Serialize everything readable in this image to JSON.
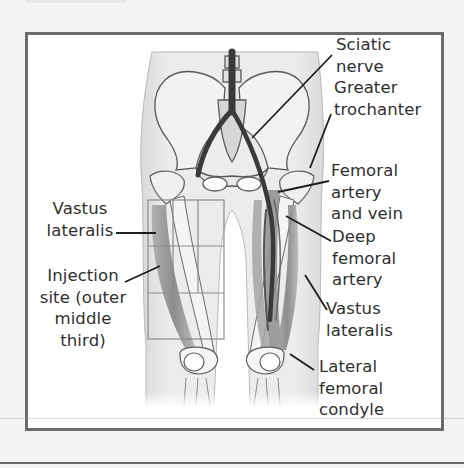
{
  "figure": {
    "labels_right": [
      {
        "id": "sciatic-nerve",
        "lines": [
          "Sciatic",
          "nerve"
        ]
      },
      {
        "id": "greater-trochanter",
        "lines": [
          "Greater",
          "trochanter"
        ]
      },
      {
        "id": "femoral-artery-and-vein",
        "lines": [
          "Femoral",
          "artery",
          "and vein"
        ]
      },
      {
        "id": "deep-femoral-artery",
        "lines": [
          "Deep",
          "femoral",
          "artery"
        ]
      },
      {
        "id": "vastus-lateralis-right",
        "lines": [
          "Vastus",
          "lateralis"
        ]
      },
      {
        "id": "lateral-femoral-condyle",
        "lines": [
          "Lateral",
          "femoral",
          "condyle"
        ]
      }
    ],
    "labels_left": [
      {
        "id": "vastus-lateralis-left",
        "lines": [
          "Vastus",
          "lateralis"
        ]
      },
      {
        "id": "injection-site",
        "lines": [
          "Injection",
          "site (outer",
          "middle",
          "third)"
        ]
      }
    ],
    "colors": {
      "frame_border": "#6b6b6b",
      "background": "#ffffff",
      "page": "#f4f4f3",
      "bone_outline": "#5a5a5a",
      "vessel": "#3a3a3a",
      "grid": "#8a8a8a"
    }
  }
}
